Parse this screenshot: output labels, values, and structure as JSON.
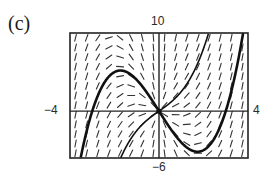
{
  "panel": {
    "label": "(c)"
  },
  "window": {
    "xmin_label": "−4",
    "xmax_label": "4",
    "ymin_label": "−6",
    "ymax_label": "10"
  },
  "chart_data": {
    "type": "slope_field",
    "title": "(c)",
    "differential_equation": "dy/dx = x^2 + y/x",
    "xlim": [
      -4,
      4
    ],
    "ylim": [
      -6,
      10
    ],
    "axes": {
      "x_axis_at_y": 0,
      "y_axis_at_x": 0
    },
    "grid": false,
    "slope_field": {
      "columns": 16,
      "rows": 13,
      "segment_length_px": 7
    },
    "solution_curves": [
      {
        "name": "particular solution (thick)",
        "formula": "y = x^3/2 - 4.5x",
        "C": -4.5,
        "stroke_width": 2.6,
        "key_points": [
          [
            -3,
            0
          ],
          [
            -1.73,
            5.2
          ],
          [
            0,
            0
          ],
          [
            1.73,
            -5.2
          ],
          [
            3,
            0
          ]
        ]
      },
      {
        "name": "solution through origin (thin)",
        "formula": "y = x^3/2 + 2x",
        "C": 2,
        "stroke_width": 1.6,
        "key_points": [
          [
            -1.7,
            -5.9
          ],
          [
            0,
            0
          ],
          [
            2.2,
            9.7
          ]
        ]
      }
    ],
    "frame_px": {
      "left": 70,
      "top": 33,
      "right": 248,
      "bottom": 158
    }
  }
}
